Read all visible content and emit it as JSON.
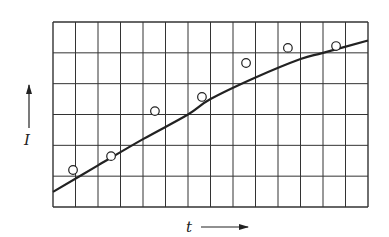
{
  "chart_data": {
    "type": "scatter",
    "title": "",
    "xlabel": "t",
    "ylabel": "I",
    "xlim": [
      0,
      14
    ],
    "ylim": [
      0,
      6
    ],
    "grid": true,
    "grid_columns": 14,
    "grid_rows": 6,
    "tick_labels": false,
    "legend": null,
    "series": [
      {
        "name": "measured",
        "type": "scatter",
        "marker": "open-circle",
        "x": [
          0.89,
          2.58,
          4.53,
          6.62,
          8.58,
          10.44,
          12.58
        ],
        "y": [
          1.2,
          1.65,
          3.11,
          3.57,
          4.67,
          5.16,
          5.22
        ]
      },
      {
        "name": "fit",
        "type": "line",
        "x": [
          0,
          2,
          4,
          6,
          7,
          9,
          11,
          12,
          14
        ],
        "y": [
          0.49,
          1.35,
          2.2,
          3.0,
          3.5,
          4.2,
          4.8,
          5.0,
          5.4
        ]
      }
    ]
  },
  "labels": {
    "x_axis": "t",
    "y_axis": "I"
  },
  "colors": {
    "ink": "#222222",
    "grid": "#333333",
    "background": "#ffffff"
  }
}
